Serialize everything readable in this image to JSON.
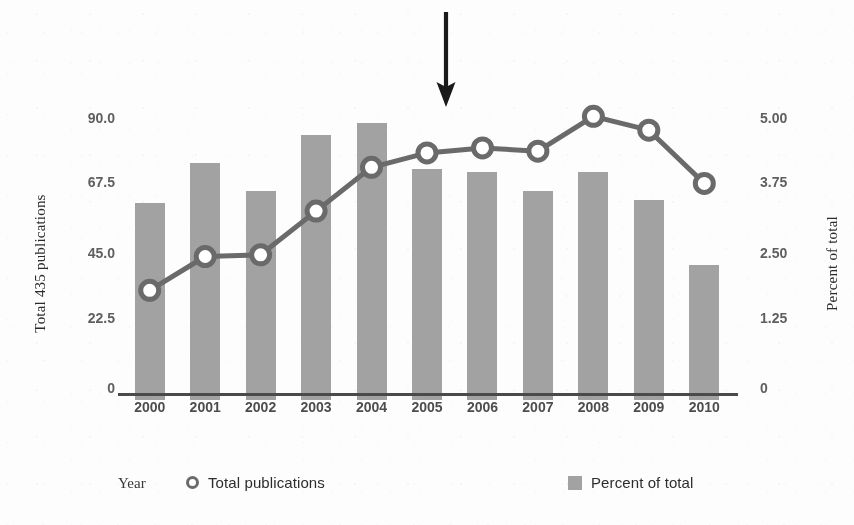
{
  "chart_data": {
    "type": "bar",
    "title": "",
    "xlabel": "Year",
    "ylabel": "Total 435 publications",
    "y2label": "Percent of total",
    "categories": [
      "2000",
      "2001",
      "2002",
      "2003",
      "2004",
      "2005",
      "2006",
      "2007",
      "2008",
      "2009",
      "2010"
    ],
    "ylim": [
      0,
      90
    ],
    "y2lim": [
      0,
      5.0
    ],
    "grid": false,
    "legend_position": "bottom",
    "series": [
      {
        "name": "Percent of total",
        "type": "bar",
        "axis": "left",
        "color": "#a2a2a2",
        "values": [
          64,
          77,
          68,
          86,
          90,
          75,
          74,
          68,
          74,
          65,
          44
        ]
      },
      {
        "name": "Total publications",
        "type": "line",
        "axis": "right",
        "color": "#6a6a6a",
        "marker": "open-circle",
        "values": [
          1.89,
          2.5,
          2.53,
          3.32,
          4.11,
          4.37,
          4.46,
          4.4,
          5.03,
          4.78,
          3.82
        ]
      }
    ],
    "annotations": [
      {
        "name": "down-arrow",
        "points_to_category": "2005-2006",
        "color": "#1a1a1a"
      }
    ]
  },
  "axes": {
    "left": {
      "title": "Total 435 publications",
      "ticks": [
        "90.0",
        "67.5",
        "45.0",
        "22.5",
        "0"
      ],
      "tick_values": [
        90.0,
        67.5,
        45.0,
        22.5,
        0
      ]
    },
    "right": {
      "title": "Percent of total",
      "ticks": [
        "5.00",
        "3.75",
        "2.50",
        "1.25",
        "0"
      ],
      "tick_values": [
        5.0,
        3.75,
        2.5,
        1.25,
        0
      ]
    },
    "bottom": {
      "ticks": [
        "2000",
        "2001",
        "2002",
        "2003",
        "2004",
        "2005",
        "2006",
        "2007",
        "2008",
        "2009",
        "2010"
      ]
    }
  },
  "legend": {
    "year_label": "Year",
    "line_entry_label": "Total publications",
    "bar_entry_label": "Percent of total"
  },
  "colors": {
    "bar": "#a2a2a2",
    "line": "#6a6a6a",
    "axis": "#4a4a4a",
    "arrow": "#1a1a1a",
    "tick_text": "#5f5f5f"
  }
}
